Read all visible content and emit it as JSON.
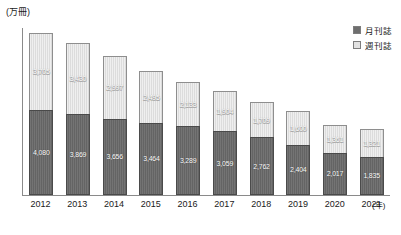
{
  "chart_data": {
    "type": "bar",
    "stacked": true,
    "title": "",
    "subtitle": "",
    "xlabel": "(年)",
    "ylabel": "(万冊)",
    "unit_label": "(万冊)",
    "x_axis_unit": "(年)",
    "grid": false,
    "legend_position": "top-right",
    "ylim": [
      0,
      8000
    ],
    "categories": [
      "2012",
      "2013",
      "2014",
      "2015",
      "2016",
      "2017",
      "2018",
      "2019",
      "2020",
      "2021"
    ],
    "series": [
      {
        "name": "月刊誌",
        "key": "monthly",
        "color": "#646464",
        "values": [
          4080,
          3869,
          3656,
          3464,
          3289,
          3059,
          2762,
          2404,
          2017,
          1835
        ],
        "labels": [
          "4,080",
          "3,869",
          "3,656",
          "3,464",
          "3,289",
          "3,059",
          "2,762",
          "2,404",
          "2,017",
          "1,835"
        ]
      },
      {
        "name": "週刊誌",
        "key": "weekly",
        "color": "#dcdcdc",
        "values": [
          3705,
          3430,
          2997,
          2495,
          2133,
          1904,
          1709,
          1600,
          1361,
          1321
        ],
        "labels": [
          "3,705",
          "3,430",
          "2,997",
          "2,495",
          "2,133",
          "1,904",
          "1,709",
          "1,600",
          "1,361",
          "1,321"
        ]
      }
    ],
    "legend": [
      {
        "label": "月刊誌",
        "key": "monthly",
        "color": "#646464"
      },
      {
        "label": "週刊誌",
        "key": "weekly",
        "color": "#dcdcdc"
      }
    ]
  },
  "colors": {
    "monthly": "#646464",
    "weekly": "#dcdcdc",
    "axis": "#8a8a8a",
    "text": "#1a1a1a",
    "background": "#ffffff"
  }
}
